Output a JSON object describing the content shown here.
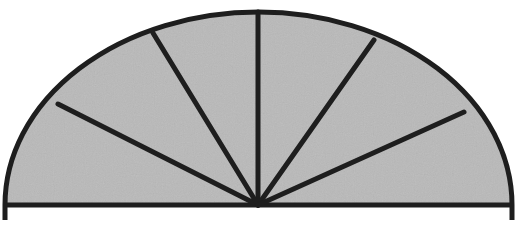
{
  "diagram": {
    "type": "semicircle-divided-into-sectors",
    "sector_count": 6,
    "colors": {
      "fill": "#b9b9b9",
      "stroke": "#1e1e1e",
      "background": "#ffffff"
    },
    "geometry": {
      "center": [
        258,
        205
      ],
      "left_end": [
        5,
        205
      ],
      "right_end": [
        512,
        205
      ],
      "apex": [
        258,
        12
      ],
      "stroke_width": 5
    },
    "spoke_endpoints": [
      [
        58,
        104
      ],
      [
        153,
        33
      ],
      [
        258,
        12
      ],
      [
        374,
        40
      ],
      [
        464,
        112
      ]
    ]
  }
}
